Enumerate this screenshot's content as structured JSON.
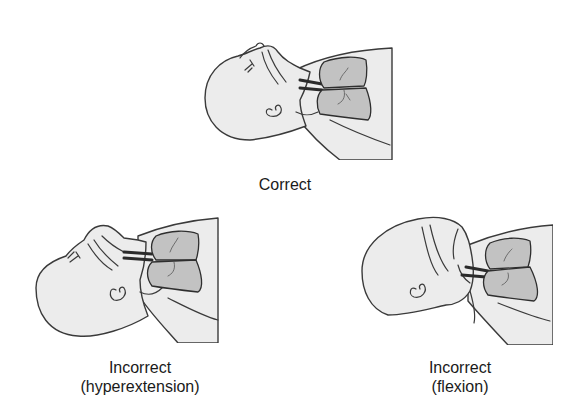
{
  "figure": {
    "panels": [
      {
        "id": "correct",
        "label": "Correct",
        "illustration": "infant-head-airway-neutral-icon"
      },
      {
        "id": "hyperextension",
        "label_line1": "Incorrect",
        "label_line2": "(hyperextension)",
        "illustration": "infant-head-airway-hyperextended-icon"
      },
      {
        "id": "flexion",
        "label_line1": "Incorrect",
        "label_line2": "(flexion)",
        "illustration": "infant-head-airway-flexed-icon"
      }
    ],
    "colors": {
      "background": "#ffffff",
      "skin": "#ececec",
      "outline": "#3a3a3a",
      "lungs": "#c2c2c2",
      "text": "#1a1a1a"
    }
  }
}
